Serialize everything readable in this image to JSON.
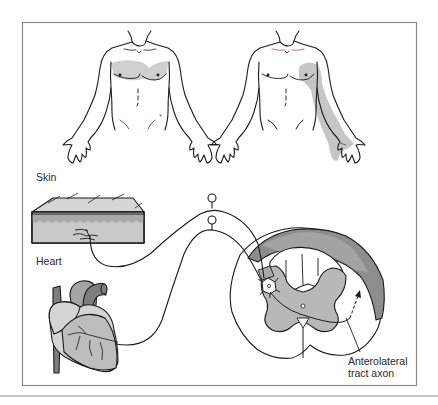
{
  "figure": {
    "labels": {
      "skin": "Skin",
      "heart": "Heart",
      "axon_line1": "Anterolateral",
      "axon_line2": "tract axon"
    },
    "torsos": [
      {
        "name": "left-torso",
        "shaded_region": "upper chest (both pectorals)"
      },
      {
        "name": "right-torso",
        "shaded_region": "left chest, shoulder and inner arm down to hand"
      }
    ],
    "colors": {
      "line": "#1a1a1a",
      "frame": "#8a8a8a",
      "shade_light": "#cfcfcf",
      "shade_mid": "#b8b8b8",
      "shade_dark": "#8d8d8d",
      "skin_top": "#d6d6d6",
      "skin_epidermis": "#a9a9a9",
      "skin_dermis": "#c9c9c9",
      "heart_light": "#d4d4d4",
      "heart_mid": "#bdbdbd",
      "heart_dark": "#7e7e7e",
      "accent_blue": "#5a56b8",
      "accent_red": "#b24a5a",
      "accent_green": "#4a8a4a"
    }
  }
}
